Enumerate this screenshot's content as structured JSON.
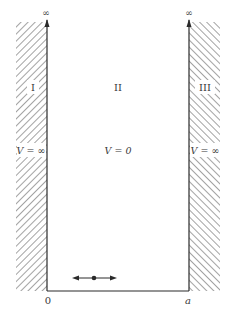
{
  "diagram": {
    "type": "infinite-square-well",
    "axis_top_left": "∞",
    "axis_top_right": "∞",
    "regions": [
      {
        "id": "I",
        "label": "I",
        "potential": "V = ∞"
      },
      {
        "id": "II",
        "label": "II",
        "potential": "V = 0"
      },
      {
        "id": "III",
        "label": "III",
        "potential": "V = ∞"
      }
    ],
    "x_ticks": [
      {
        "label": "0"
      },
      {
        "label": "a"
      }
    ],
    "particle": "particle-with-bidirectional-arrow",
    "colors": {
      "line": "#2a2a2a",
      "hatch": "#555555",
      "background": "#ffffff"
    }
  }
}
